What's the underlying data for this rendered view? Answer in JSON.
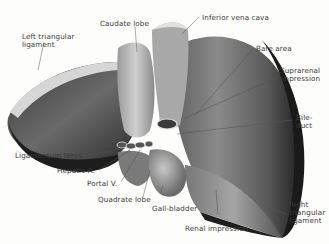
{
  "figure": {
    "labels": {
      "left_triangular_ligament": "Left triangular ligament",
      "left_triangular_line1": "Left triangular",
      "left_triangular_line2": "ligament",
      "caudate_lobe": "Caudate lobe",
      "inferior_vena_cava": "Inferior vena cava",
      "bare_area": "Bare area",
      "suprarenal_line1": "Suprarenal",
      "suprarenal_line2": "impression",
      "bile_line1": "Bile-",
      "bile_line2": "duct",
      "ligamentum_teres": "Ligamentum teres",
      "hepatic_a": "Hepatic A.",
      "portal_v": "Portal V.",
      "quadrate_lobe": "Quadrate lobe",
      "gall_bladder": "Gall-bladder",
      "renal_impression": "Renal impression",
      "right_tri_line1": "Right",
      "right_tri_line2": "triangular",
      "right_tri_line3": "ligament"
    },
    "colors": {
      "background": "#fdfdfb",
      "dark_tissue": "#2b2b2b",
      "mid_tissue": "#6e6e6e",
      "light_tissue": "#b9b9b9",
      "label_text": "#3a3a3a",
      "leader_line": "#555555"
    }
  }
}
